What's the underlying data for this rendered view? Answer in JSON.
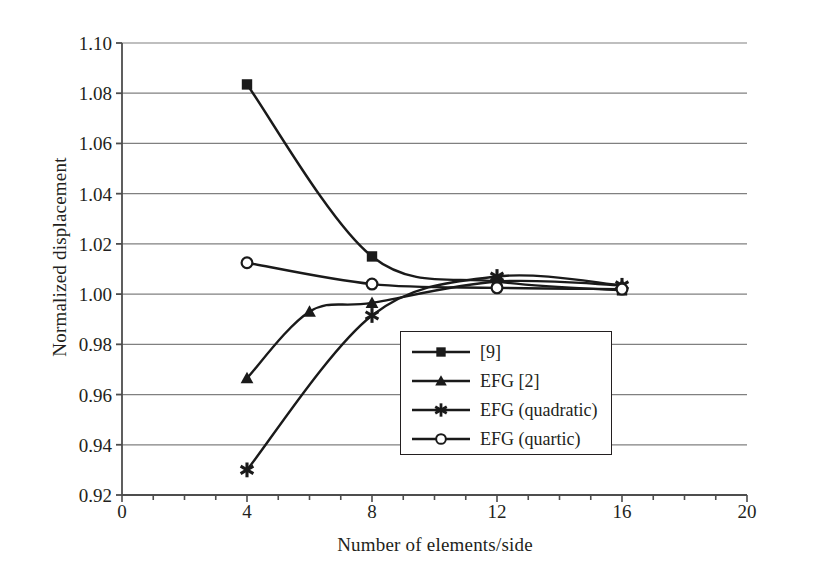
{
  "chart_data": {
    "type": "line",
    "title": "",
    "xlabel": "Number of elements/side",
    "ylabel": "Normalized displacement",
    "xlim": [
      0,
      20
    ],
    "ylim": [
      0.92,
      1.1
    ],
    "xticks": [
      "0",
      "4",
      "8",
      "12",
      "16",
      "20"
    ],
    "xtick_values": [
      0,
      4,
      8,
      12,
      16,
      20
    ],
    "x_minor_tick_step": 1,
    "yticks": [
      "0.92",
      "0.94",
      "0.96",
      "0.98",
      "1.00",
      "1.02",
      "1.04",
      "1.06",
      "1.08",
      "1.10"
    ],
    "ytick_values": [
      0.92,
      0.94,
      0.96,
      0.98,
      1.0,
      1.02,
      1.04,
      1.06,
      1.08,
      1.1
    ],
    "grid": "horizontal",
    "grid_color": "#808080",
    "line_color": "#1a1a1a",
    "legend_position": "center",
    "series": [
      {
        "name": "[9]",
        "marker": "filled-square",
        "x": [
          4,
          8,
          12,
          16
        ],
        "values": [
          1.0835,
          1.015,
          1.005,
          1.0015
        ]
      },
      {
        "name": "EFG [2]",
        "marker": "filled-triangle",
        "x": [
          4,
          6,
          8,
          12,
          16
        ],
        "values": [
          0.9665,
          0.993,
          0.9965,
          1.005,
          1.0035
        ]
      },
      {
        "name": "EFG (quadratic)",
        "marker": "asterisk",
        "x": [
          4,
          8,
          12,
          16
        ],
        "values": [
          0.93,
          0.9915,
          1.007,
          1.0035
        ]
      },
      {
        "name": "EFG (quartic)",
        "marker": "open-circle",
        "x": [
          4,
          8,
          12,
          16
        ],
        "values": [
          1.0125,
          1.004,
          1.0025,
          1.002
        ]
      }
    ]
  },
  "legend": {
    "items": [
      {
        "label": "[9]"
      },
      {
        "label": "EFG [2]"
      },
      {
        "label": "EFG (quadratic)"
      },
      {
        "label": "EFG (quartic)"
      }
    ]
  }
}
